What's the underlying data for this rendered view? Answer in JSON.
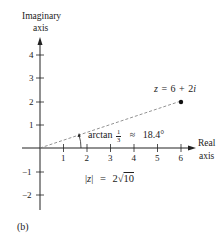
{
  "figure": {
    "panel_label": "(b)",
    "y_axis": {
      "label_line1": "Imaginary",
      "label_line2": "axis",
      "ticks": [
        "4",
        "3",
        "2",
        "1",
        "−1",
        "−2"
      ]
    },
    "x_axis": {
      "label_line1": "Real",
      "label_line2": "axis",
      "ticks": [
        "1",
        "2",
        "3",
        "4",
        "5",
        "6"
      ]
    },
    "point": {
      "label_z": "z",
      "label_eq": "=",
      "label_value": "6 + 2",
      "label_i": "i",
      "x": 6,
      "y": 2
    },
    "angle": {
      "label_fn": "arctan",
      "frac_num": "1",
      "frac_den": "3",
      "label_approx": "≈",
      "label_value": "18.4°"
    },
    "modulus": {
      "label_left": "|",
      "label_z": "z",
      "label_right": "|",
      "label_eq": "=",
      "label_coef": "2",
      "label_root": "√",
      "label_radicand": "10"
    }
  },
  "colors": {
    "ink": "#222222",
    "dashed": "#777777",
    "background": "#ffffff"
  }
}
